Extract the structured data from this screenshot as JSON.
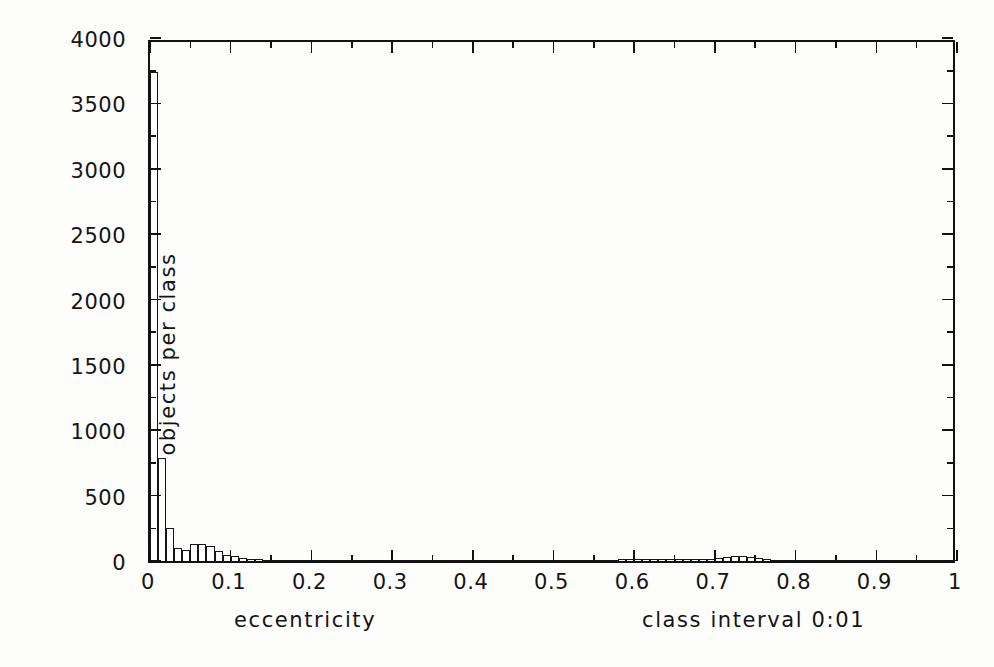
{
  "figure": {
    "background": "#fdfdfc",
    "ink_color": "#141414"
  },
  "axis_titles": {
    "x": "eccentricity",
    "y": "objects per class",
    "note": "class interval 0:01"
  },
  "x_tick_labels": [
    "0",
    "0.1",
    "0.2",
    "0.3",
    "0.4",
    "0.5",
    "0.6",
    "0.7",
    "0.8",
    "0.9",
    "1"
  ],
  "y_tick_labels": [
    "0",
    "500",
    "1000",
    "1500",
    "2000",
    "2500",
    "3000",
    "3500",
    "4000"
  ],
  "chart_data": {
    "type": "bar",
    "title": "",
    "subtitle": "",
    "xlabel": "eccentricity",
    "ylabel": "objects per class",
    "annotations": [
      "class interval 0:01"
    ],
    "xlim": [
      0,
      1
    ],
    "ylim": [
      0,
      4000
    ],
    "bin_width": 0.01,
    "x_major_tick_step": 0.1,
    "x_minor_tick_step": 0.05,
    "y_major_tick_step": 500,
    "y_minor_tick_step": 250,
    "grid": false,
    "legend": null,
    "legend_position": "none",
    "bar_style": {
      "fill": "#ffffff",
      "edge": "#161616"
    },
    "bin_left_edges": [
      0.0,
      0.01,
      0.02,
      0.03,
      0.04,
      0.05,
      0.06,
      0.07,
      0.08,
      0.09,
      0.1,
      0.11,
      0.12,
      0.13,
      0.14,
      0.15,
      0.16,
      0.17,
      0.18,
      0.19,
      0.2,
      0.21,
      0.22,
      0.23,
      0.24,
      0.25,
      0.26,
      0.27,
      0.28,
      0.29,
      0.3,
      0.31,
      0.32,
      0.33,
      0.34,
      0.35,
      0.36,
      0.37,
      0.38,
      0.39,
      0.4,
      0.41,
      0.42,
      0.43,
      0.44,
      0.45,
      0.46,
      0.47,
      0.48,
      0.49,
      0.5,
      0.51,
      0.52,
      0.53,
      0.54,
      0.55,
      0.56,
      0.57,
      0.58,
      0.59,
      0.6,
      0.61,
      0.62,
      0.63,
      0.64,
      0.65,
      0.66,
      0.67,
      0.68,
      0.69,
      0.7,
      0.71,
      0.72,
      0.73,
      0.74,
      0.75,
      0.76,
      0.77,
      0.78,
      0.79,
      0.8,
      0.81,
      0.82,
      0.83,
      0.84,
      0.85,
      0.86,
      0.87,
      0.88,
      0.89,
      0.9,
      0.91,
      0.92,
      0.93,
      0.94,
      0.95,
      0.96,
      0.97,
      0.98,
      0.99
    ],
    "values": [
      3740,
      790,
      250,
      100,
      85,
      130,
      130,
      115,
      80,
      45,
      35,
      25,
      18,
      12,
      10,
      8,
      7,
      6,
      6,
      5,
      10,
      4,
      4,
      4,
      5,
      4,
      3,
      3,
      4,
      3,
      4,
      3,
      3,
      3,
      3,
      3,
      4,
      3,
      3,
      3,
      6,
      3,
      3,
      3,
      3,
      3,
      3,
      3,
      4,
      3,
      5,
      3,
      4,
      4,
      6,
      8,
      9,
      10,
      12,
      14,
      16,
      13,
      12,
      14,
      16,
      15,
      13,
      12,
      14,
      18,
      24,
      28,
      36,
      38,
      30,
      22,
      14,
      9,
      5,
      3,
      3,
      2,
      2,
      2,
      2,
      3,
      2,
      2,
      2,
      2,
      2,
      2,
      2,
      2,
      2,
      3,
      2,
      2,
      2,
      2
    ],
    "peak": {
      "bin": 0.0,
      "value": 3740
    },
    "secondary_peak": {
      "bin": 0.73,
      "value": 38
    }
  }
}
